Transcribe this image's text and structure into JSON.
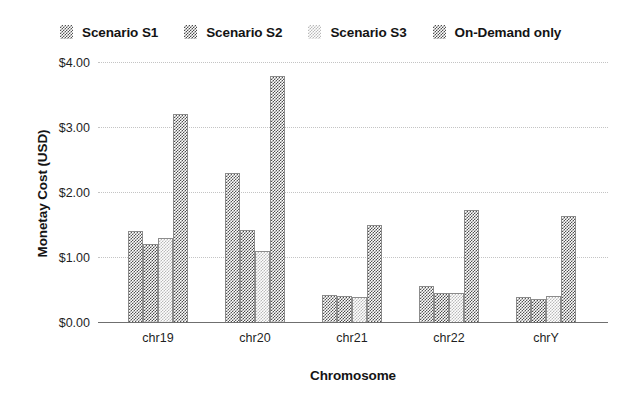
{
  "chart_data": {
    "type": "bar",
    "title": "",
    "xlabel": "Chromosome",
    "ylabel": "Monetay Cost (USD)",
    "categories": [
      "chr19",
      "chr20",
      "chr21",
      "chr22",
      "chrY"
    ],
    "ylim": [
      0,
      4
    ],
    "yticks": [
      "$0.00",
      "$1.00",
      "$2.00",
      "$3.00",
      "$4.00"
    ],
    "ytick_values": [
      0,
      1,
      2,
      3,
      4
    ],
    "grid": true,
    "legend_position": "top",
    "series": [
      {
        "name": "Scenario S1",
        "color": "#555555",
        "values": [
          1.4,
          2.3,
          0.42,
          0.55,
          0.38
        ]
      },
      {
        "name": "Scenario S2",
        "color": "#4a4a4a",
        "values": [
          1.2,
          1.42,
          0.4,
          0.45,
          0.35
        ]
      },
      {
        "name": "Scenario S3",
        "color": "#b9b9b9",
        "values": [
          1.3,
          1.1,
          0.38,
          0.45,
          0.4
        ]
      },
      {
        "name": "On-Demand only",
        "color": "#4f4f4f",
        "values": [
          3.2,
          3.78,
          1.5,
          1.72,
          1.63
        ]
      }
    ]
  }
}
